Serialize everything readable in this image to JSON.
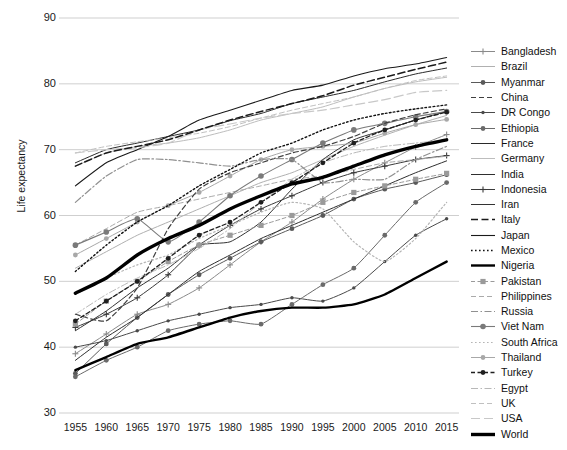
{
  "chart_data": {
    "type": "line",
    "title": "",
    "xlabel": "",
    "ylabel": "Life expectancy",
    "xlim": [
      1953,
      2017
    ],
    "ylim": [
      30,
      90
    ],
    "ytick_labels": [
      "30",
      "40",
      "50",
      "60",
      "70",
      "80",
      "90"
    ],
    "ytick_values": [
      30,
      40,
      50,
      60,
      70,
      80,
      90
    ],
    "x": [
      1955,
      1960,
      1965,
      1970,
      1975,
      1980,
      1985,
      1990,
      1995,
      2000,
      2005,
      2010,
      2015
    ],
    "xtick_labels": [
      "1955",
      "1960",
      "1965",
      "1970",
      "1975",
      "1980",
      "1985",
      "1990",
      "1995",
      "2000",
      "2005",
      "2010",
      "2015"
    ],
    "grid": "horizontal",
    "legend_position": "right",
    "series": [
      {
        "name": "Bangladesh",
        "style": "solid-marker",
        "color": "#8a8a8a",
        "width": 1.0,
        "marker": "plus",
        "values": [
          39.0,
          42.0,
          45.0,
          46.5,
          49.0,
          52.5,
          56.0,
          59.0,
          62.5,
          65.5,
          68.0,
          70.4,
          72.3
        ]
      },
      {
        "name": "Brazil",
        "style": "solid",
        "color": "#b0b0b0",
        "width": 1.0,
        "marker": "none",
        "values": [
          52.0,
          54.5,
          57.0,
          59.0,
          61.0,
          63.0,
          65.0,
          66.5,
          68.5,
          70.5,
          72.2,
          73.8,
          75.2
        ]
      },
      {
        "name": "Myanmar",
        "style": "solid-marker",
        "color": "#5a5a5a",
        "width": 1.0,
        "marker": "dot",
        "values": [
          36.0,
          40.5,
          44.5,
          48.0,
          51.0,
          53.5,
          56.0,
          58.0,
          60.0,
          62.5,
          64.0,
          65.0,
          66.2
        ]
      },
      {
        "name": "China",
        "style": "dashed",
        "color": "#404040",
        "width": 1.2,
        "marker": "none",
        "values": [
          45.0,
          44.0,
          49.0,
          58.0,
          64.0,
          66.5,
          68.0,
          69.5,
          70.5,
          72.0,
          74.0,
          75.3,
          76.2
        ]
      },
      {
        "name": "DR Congo",
        "style": "solid-marker",
        "color": "#4a4a4a",
        "width": 1.0,
        "marker": "dot-small",
        "values": [
          40.0,
          41.0,
          42.5,
          44.0,
          45.0,
          46.0,
          46.5,
          47.5,
          47.0,
          49.0,
          53.0,
          57.0,
          59.5
        ]
      },
      {
        "name": "Ethiopia",
        "style": "solid-marker",
        "color": "#6a6a6a",
        "width": 1.0,
        "marker": "dot",
        "values": [
          35.5,
          38.0,
          40.0,
          42.5,
          43.5,
          44.0,
          43.5,
          46.5,
          49.5,
          52.0,
          57.0,
          62.0,
          65.0
        ]
      },
      {
        "name": "France",
        "style": "solid",
        "color": "#2a2a2a",
        "width": 1.0,
        "marker": "none",
        "values": [
          68.0,
          70.0,
          71.0,
          72.0,
          73.0,
          74.4,
          75.5,
          77.0,
          78.0,
          79.0,
          80.3,
          81.5,
          82.4
        ]
      },
      {
        "name": "Germany",
        "style": "solid",
        "color": "#bdbdbd",
        "width": 1.0,
        "marker": "none",
        "values": [
          67.5,
          69.5,
          70.5,
          71.0,
          71.8,
          73.0,
          74.5,
          75.5,
          76.5,
          78.0,
          79.3,
          80.3,
          81.0
        ]
      },
      {
        "name": "India",
        "style": "solid",
        "color": "#2f2f2f",
        "width": 1.0,
        "marker": "none",
        "values": [
          38.0,
          41.5,
          44.5,
          48.0,
          51.5,
          54.0,
          56.5,
          58.5,
          60.5,
          62.5,
          64.5,
          66.5,
          68.3
        ]
      },
      {
        "name": "Indonesia",
        "style": "solid-marker",
        "color": "#3a3a3a",
        "width": 1.0,
        "marker": "plus",
        "values": [
          43.0,
          45.0,
          47.5,
          51.0,
          55.5,
          58.5,
          61.0,
          63.0,
          65.0,
          66.5,
          67.5,
          68.5,
          69.1
        ]
      },
      {
        "name": "Iran",
        "style": "solid",
        "color": "#333",
        "width": 1.0,
        "marker": "none",
        "values": [
          42.5,
          45.5,
          49.0,
          52.0,
          55.5,
          56.0,
          59.0,
          64.0,
          68.5,
          71.5,
          73.0,
          74.5,
          75.8
        ]
      },
      {
        "name": "Italy",
        "style": "dashed",
        "color": "#1a1a1a",
        "width": 1.5,
        "marker": "none",
        "values": [
          67.5,
          69.5,
          70.5,
          71.5,
          73.0,
          74.5,
          75.8,
          77.0,
          78.2,
          79.8,
          81.0,
          82.2,
          83.3
        ]
      },
      {
        "name": "Japan",
        "style": "solid",
        "color": "#1a1a1a",
        "width": 1.1,
        "marker": "none",
        "values": [
          64.5,
          68.0,
          70.0,
          72.0,
          74.5,
          76.0,
          77.5,
          79.0,
          79.8,
          81.2,
          82.3,
          83.0,
          84.0
        ]
      },
      {
        "name": "Mexico",
        "style": "dotted",
        "color": "#111",
        "width": 1.4,
        "marker": "none",
        "values": [
          51.5,
          55.5,
          59.0,
          61.5,
          64.5,
          67.0,
          69.5,
          71.0,
          73.0,
          74.5,
          75.5,
          76.2,
          76.8
        ]
      },
      {
        "name": "Nigeria",
        "style": "solid",
        "color": "#000",
        "width": 2.4,
        "marker": "none",
        "values": [
          36.5,
          38.5,
          40.5,
          41.5,
          43.0,
          44.5,
          45.5,
          46.0,
          46.0,
          46.5,
          48.0,
          50.5,
          53.0
        ]
      },
      {
        "name": "Pakistan",
        "style": "dashed-marker",
        "color": "#9a9a9a",
        "width": 1.0,
        "marker": "square",
        "values": [
          43.5,
          47.0,
          50.0,
          53.0,
          55.5,
          57.0,
          58.5,
          60.0,
          62.0,
          63.5,
          64.5,
          65.5,
          66.4
        ]
      },
      {
        "name": "Philippines",
        "style": "dashed",
        "color": "#aaa",
        "width": 1.0,
        "marker": "none",
        "values": [
          55.5,
          58.0,
          60.5,
          61.5,
          62.5,
          63.5,
          64.5,
          65.5,
          66.0,
          67.0,
          68.0,
          68.5,
          69.0
        ]
      },
      {
        "name": "Russia",
        "style": "dashdot",
        "color": "#909090",
        "width": 1.2,
        "marker": "none",
        "values": [
          62.0,
          66.0,
          68.5,
          68.5,
          68.0,
          67.5,
          68.5,
          68.5,
          65.0,
          65.5,
          65.5,
          68.5,
          70.5
        ]
      },
      {
        "name": "Viet Nam",
        "style": "solid-marker",
        "color": "#7a7a7a",
        "width": 1.1,
        "marker": "circle",
        "values": [
          55.5,
          57.5,
          59.5,
          56.0,
          59.0,
          63.0,
          66.0,
          68.5,
          71.0,
          73.0,
          74.0,
          75.0,
          75.8
        ]
      },
      {
        "name": "South Africa",
        "style": "dotted",
        "color": "#b5b5b5",
        "width": 1.2,
        "marker": "none",
        "values": [
          48.0,
          50.5,
          52.5,
          54.0,
          56.5,
          58.5,
          60.5,
          62.0,
          61.0,
          56.0,
          53.0,
          56.5,
          62.0
        ]
      },
      {
        "name": "Thailand",
        "style": "solid-marker",
        "color": "#a8a8a8",
        "width": 1.0,
        "marker": "dot",
        "values": [
          54.0,
          56.5,
          59.0,
          61.5,
          63.5,
          66.0,
          68.5,
          70.0,
          70.5,
          71.0,
          72.5,
          73.8,
          74.6
        ]
      },
      {
        "name": "Turkey",
        "style": "dashed-marker",
        "color": "#1f1f1f",
        "width": 1.3,
        "marker": "dot",
        "values": [
          44.0,
          47.0,
          50.0,
          53.5,
          57.0,
          59.0,
          62.0,
          65.0,
          68.0,
          71.0,
          73.0,
          74.5,
          75.7
        ]
      },
      {
        "name": "Egypt",
        "style": "dashdot",
        "color": "#b8b8b8",
        "width": 1.0,
        "marker": "none",
        "values": [
          45.0,
          48.0,
          50.5,
          52.5,
          55.0,
          58.0,
          62.0,
          65.5,
          68.0,
          69.5,
          70.5,
          71.0,
          71.5
        ]
      },
      {
        "name": "UK",
        "style": "dashed",
        "color": "#c0c0c0",
        "width": 1.0,
        "marker": "none",
        "values": [
          69.5,
          70.5,
          71.2,
          71.8,
          72.5,
          73.5,
          74.8,
          76.0,
          77.0,
          78.0,
          79.3,
          80.5,
          81.2
        ]
      },
      {
        "name": "USA",
        "style": "dashed-long",
        "color": "#c8c8c8",
        "width": 1.2,
        "marker": "none",
        "values": [
          69.5,
          70.0,
          70.3,
          71.0,
          73.0,
          73.9,
          74.8,
          75.5,
          76.0,
          76.8,
          77.6,
          78.7,
          79.0
        ]
      },
      {
        "name": "World",
        "style": "solid",
        "color": "#000",
        "width": 3.4,
        "marker": "none",
        "values": [
          48.2,
          50.5,
          54.0,
          56.5,
          58.5,
          61.0,
          63.0,
          64.8,
          65.8,
          67.5,
          69.2,
          70.5,
          71.5
        ]
      }
    ]
  },
  "axis": {
    "y_label": "Life expectancy"
  }
}
